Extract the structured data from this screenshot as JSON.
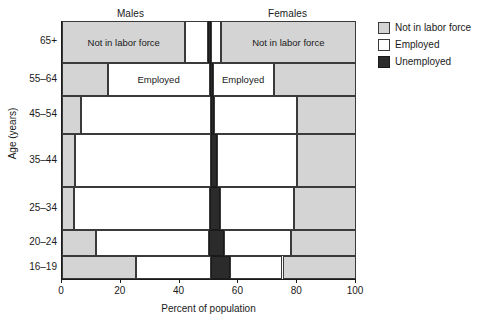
{
  "chart_data": {
    "type": "bar",
    "title": "",
    "xlabel": "Percent of population",
    "ylabel": "Age (years)",
    "xlim": [
      0,
      100
    ],
    "xticks": [
      0,
      20,
      40,
      60,
      80,
      100
    ],
    "xtick_labels": [
      "0",
      "20",
      "40",
      "60",
      "80",
      "100"
    ],
    "grid": false,
    "legend_position": "right",
    "group_headers": [
      "Males",
      "Females"
    ],
    "legend": [
      {
        "key": "nilf",
        "label": "Not in labor force",
        "color": "#d4d4d4"
      },
      {
        "key": "emp",
        "label": "Employed",
        "color": "#ffffff"
      },
      {
        "key": "unemp",
        "label": "Unemployed",
        "color": "#2b2b2b"
      }
    ],
    "categories": [
      "65+",
      "55–64",
      "45–54",
      "35–44",
      "25–34",
      "20–24",
      "16–19"
    ],
    "note": "Mosaic/spine plot: each age row is split left (Males) and right (Females); row height is proportional to that age group's share of the population. Segment values are cumulative percent-of-population boundaries along the x-axis.",
    "rows": [
      {
        "category": "65+",
        "height_px": 42,
        "segments": [
          {
            "group": "Males",
            "key": "nilf",
            "start": 0,
            "end": 42,
            "width": 42,
            "label": "Not in labor force"
          },
          {
            "group": "Males",
            "key": "emp",
            "start": 42,
            "end": 49.6,
            "width": 7.6,
            "label": ""
          },
          {
            "group": "Males",
            "key": "unemp",
            "start": 49.6,
            "end": 50.6,
            "width": 1.0,
            "label": ""
          },
          {
            "group": "Females",
            "key": "emp",
            "start": 50.6,
            "end": 54,
            "width": 3.4,
            "label": ""
          },
          {
            "group": "Females",
            "key": "nilf",
            "start": 54,
            "end": 100,
            "width": 46,
            "label": "Not in labor force"
          }
        ]
      },
      {
        "category": "55–64",
        "height_px": 33,
        "segments": [
          {
            "group": "Males",
            "key": "nilf",
            "start": 0,
            "end": 15.5,
            "width": 15.5,
            "label": ""
          },
          {
            "group": "Males",
            "key": "emp",
            "start": 15.5,
            "end": 50.2,
            "width": 34.7,
            "label": "Employed"
          },
          {
            "group": "Males",
            "key": "unemp",
            "start": 50.2,
            "end": 51.2,
            "width": 1.0,
            "label": ""
          },
          {
            "group": "Females",
            "key": "emp",
            "start": 51.2,
            "end": 72,
            "width": 20.8,
            "label": "Employed"
          },
          {
            "group": "Females",
            "key": "nilf",
            "start": 72,
            "end": 100,
            "width": 28,
            "label": ""
          }
        ]
      },
      {
        "category": "45–54",
        "height_px": 38,
        "segments": [
          {
            "group": "Males",
            "key": "nilf",
            "start": 0,
            "end": 6.5,
            "width": 6.5,
            "label": ""
          },
          {
            "group": "Males",
            "key": "emp",
            "start": 6.5,
            "end": 50.8,
            "width": 44.3,
            "label": ""
          },
          {
            "group": "Males",
            "key": "unemp",
            "start": 50.8,
            "end": 51.8,
            "width": 1.0,
            "label": ""
          },
          {
            "group": "Females",
            "key": "emp",
            "start": 51.8,
            "end": 80,
            "width": 28.2,
            "label": ""
          },
          {
            "group": "Females",
            "key": "nilf",
            "start": 80,
            "end": 100,
            "width": 20,
            "label": ""
          }
        ]
      },
      {
        "category": "35–44",
        "height_px": 53,
        "segments": [
          {
            "group": "Males",
            "key": "nilf",
            "start": 0,
            "end": 4.5,
            "width": 4.5,
            "label": ""
          },
          {
            "group": "Males",
            "key": "emp",
            "start": 4.5,
            "end": 50.6,
            "width": 46.1,
            "label": ""
          },
          {
            "group": "Males",
            "key": "unemp",
            "start": 50.6,
            "end": 52.6,
            "width": 2.0,
            "label": ""
          },
          {
            "group": "Females",
            "key": "emp",
            "start": 52.6,
            "end": 80,
            "width": 27.4,
            "label": ""
          },
          {
            "group": "Females",
            "key": "nilf",
            "start": 80,
            "end": 100,
            "width": 20,
            "label": ""
          }
        ]
      },
      {
        "category": "25–34",
        "height_px": 43,
        "segments": [
          {
            "group": "Males",
            "key": "nilf",
            "start": 0,
            "end": 4,
            "width": 4,
            "label": ""
          },
          {
            "group": "Males",
            "key": "emp",
            "start": 4,
            "end": 50.4,
            "width": 46.4,
            "label": ""
          },
          {
            "group": "Males",
            "key": "unemp",
            "start": 50.4,
            "end": 53.6,
            "width": 3.2,
            "label": ""
          },
          {
            "group": "Females",
            "key": "emp",
            "start": 53.6,
            "end": 79,
            "width": 25.4,
            "label": ""
          },
          {
            "group": "Females",
            "key": "nilf",
            "start": 79,
            "end": 100,
            "width": 21,
            "label": ""
          }
        ]
      },
      {
        "category": "20–24",
        "height_px": 26,
        "segments": [
          {
            "group": "Males",
            "key": "nilf",
            "start": 0,
            "end": 11.5,
            "width": 11.5,
            "label": ""
          },
          {
            "group": "Males",
            "key": "emp",
            "start": 11.5,
            "end": 50,
            "width": 38.5,
            "label": ""
          },
          {
            "group": "Males",
            "key": "unemp",
            "start": 50,
            "end": 55,
            "width": 5.0,
            "label": ""
          },
          {
            "group": "Females",
            "key": "emp",
            "start": 55,
            "end": 78,
            "width": 23,
            "label": ""
          },
          {
            "group": "Females",
            "key": "nilf",
            "start": 78,
            "end": 100,
            "width": 22,
            "label": ""
          }
        ]
      },
      {
        "category": "16–19",
        "height_px": 23,
        "segments": [
          {
            "group": "Males",
            "key": "nilf",
            "start": 0,
            "end": 25,
            "width": 25,
            "label": ""
          },
          {
            "group": "Males",
            "key": "emp",
            "start": 25,
            "end": 50.8,
            "width": 25.8,
            "label": ""
          },
          {
            "group": "Males",
            "key": "unemp",
            "start": 50.8,
            "end": 57,
            "width": 6.2,
            "label": ""
          },
          {
            "group": "Females",
            "key": "emp",
            "start": 57,
            "end": 75,
            "width": 18,
            "label": ""
          },
          {
            "group": "Females",
            "key": "nilf",
            "start": 75,
            "end": 100,
            "width": 25,
            "label": ""
          }
        ]
      }
    ]
  }
}
